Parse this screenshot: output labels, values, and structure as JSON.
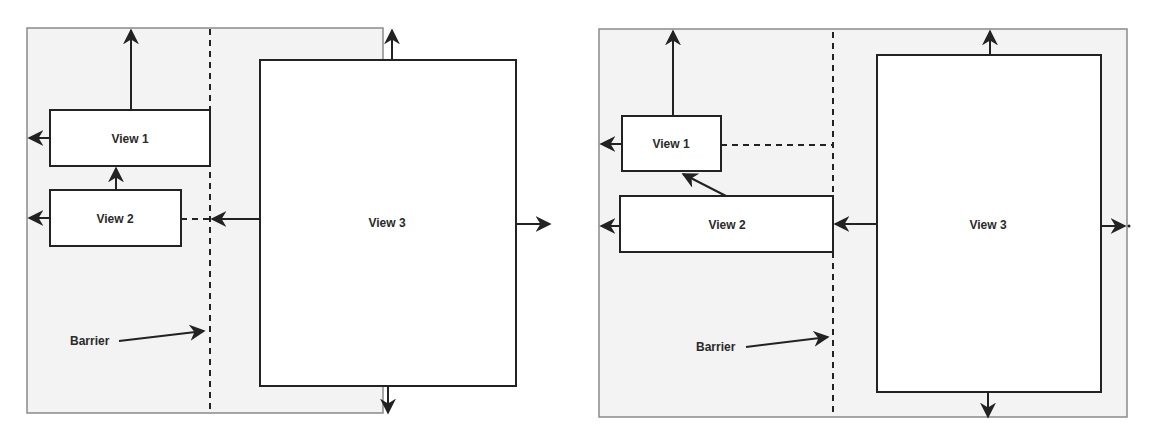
{
  "diagrams": [
    {
      "name": "left",
      "views": [
        {
          "label": "View 1"
        },
        {
          "label": "View 2"
        },
        {
          "label": "View 3"
        }
      ],
      "barrier_label": "Barrier"
    },
    {
      "name": "right",
      "views": [
        {
          "label": "View 1"
        },
        {
          "label": "View 2"
        },
        {
          "label": "View 3"
        }
      ],
      "barrier_label": "Barrier"
    }
  ],
  "colors": {
    "container_fill": "#f3f3f3",
    "container_border": "#8a8a8a",
    "view_fill": "#ffffff",
    "stroke": "#222222"
  }
}
